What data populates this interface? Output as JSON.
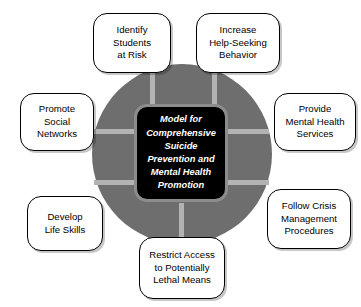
{
  "diagram": {
    "type": "hub-and-spoke",
    "title": "Model for Comprehensive Suicide Prevention and Mental Health Promotion",
    "center": {
      "label": "Model for\nComprehensive\nSuicide Prevention\nand Mental Health\nPromotion",
      "text_color": "#ffffff",
      "fill_color": "#000000",
      "border_color": "#8c8c8c"
    },
    "hub": {
      "fill_color": "#6e6e6e",
      "spoke_color": "#b3b3b3",
      "spoke_count": 7
    },
    "nodes": [
      {
        "id": "identify-students-at-risk",
        "label": "Identify\nStudents\nat Risk"
      },
      {
        "id": "increase-help-seeking",
        "label": "Increase\nHelp-Seeking\nBehavior"
      },
      {
        "id": "promote-social-networks",
        "label": "Promote\nSocial\nNetworks"
      },
      {
        "id": "provide-mental-health",
        "label": "Provide\nMental Health\nServices"
      },
      {
        "id": "develop-life-skills",
        "label": "Develop\nLife Skills"
      },
      {
        "id": "follow-crisis-management",
        "label": "Follow Crisis\nManagement\nProcedures"
      },
      {
        "id": "restrict-access-lethal-means",
        "label": "Restrict Access\nto Potentially\nLethal Means"
      }
    ],
    "node_style": {
      "fill_color": "#ffffff",
      "border_color": "#000000",
      "text_color": "#000000"
    }
  }
}
